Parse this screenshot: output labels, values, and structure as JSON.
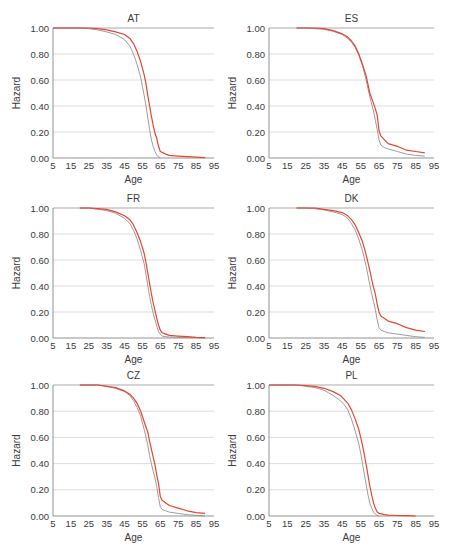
{
  "figure": {
    "colors": {
      "series_gray": "#8c9196",
      "series_red": "#e8452e",
      "grid": "#d4d4d4",
      "axis": "#777777",
      "top_line": "#a9a9a9"
    }
  },
  "chart_data": [
    {
      "type": "line",
      "title": "AT",
      "xlabel": "Age",
      "ylabel": "Hazard",
      "xlim": [
        5,
        95
      ],
      "ylim": [
        0,
        1
      ],
      "xticks": [
        "5",
        "15",
        "25",
        "35",
        "45",
        "55",
        "65",
        "75",
        "85",
        "95"
      ],
      "yticks": [
        "0.00",
        "0.20",
        "0.40",
        "0.60",
        "0.80",
        "1.00"
      ],
      "grid": true,
      "legend": null,
      "series": [
        {
          "name": "gray",
          "x": [
            5,
            15,
            20,
            25,
            30,
            35,
            40,
            45,
            48,
            50,
            52,
            54,
            55,
            56,
            57,
            58,
            59,
            60,
            61,
            62,
            63,
            64,
            65
          ],
          "values": [
            1.0,
            1.0,
            1.0,
            0.995,
            0.985,
            0.97,
            0.95,
            0.91,
            0.86,
            0.8,
            0.72,
            0.62,
            0.55,
            0.48,
            0.4,
            0.31,
            0.22,
            0.14,
            0.09,
            0.05,
            0.02,
            0.01,
            0.0
          ]
        },
        {
          "name": "red",
          "x": [
            5,
            15,
            20,
            25,
            30,
            35,
            40,
            45,
            48,
            50,
            52,
            54,
            56,
            57,
            58,
            59,
            60,
            61,
            62,
            63,
            64,
            65,
            68,
            70,
            75,
            80,
            85,
            90
          ],
          "values": [
            1.0,
            1.0,
            1.0,
            1.0,
            0.995,
            0.985,
            0.97,
            0.95,
            0.92,
            0.88,
            0.82,
            0.74,
            0.64,
            0.57,
            0.48,
            0.4,
            0.32,
            0.25,
            0.19,
            0.15,
            0.09,
            0.05,
            0.03,
            0.02,
            0.015,
            0.01,
            0.007,
            0.003
          ]
        }
      ]
    },
    {
      "type": "line",
      "title": "ES",
      "xlabel": "Age",
      "ylabel": "Hazard",
      "xlim": [
        5,
        95
      ],
      "ylim": [
        0,
        1
      ],
      "xticks": [
        "5",
        "15",
        "25",
        "35",
        "45",
        "55",
        "65",
        "75",
        "85",
        "95"
      ],
      "yticks": [
        "0.00",
        "0.20",
        "0.40",
        "0.60",
        "0.80",
        "1.00"
      ],
      "grid": true,
      "legend": null,
      "series": [
        {
          "name": "gray",
          "x": [
            20,
            25,
            30,
            35,
            40,
            45,
            48,
            50,
            52,
            54,
            56,
            58,
            60,
            62,
            63,
            64,
            65,
            66,
            68,
            70,
            75,
            80,
            85,
            90
          ],
          "values": [
            1.0,
            1.0,
            0.995,
            0.99,
            0.975,
            0.95,
            0.92,
            0.89,
            0.85,
            0.79,
            0.71,
            0.6,
            0.47,
            0.36,
            0.29,
            0.22,
            0.14,
            0.1,
            0.08,
            0.07,
            0.05,
            0.03,
            0.02,
            0.015
          ]
        },
        {
          "name": "red",
          "x": [
            20,
            25,
            30,
            35,
            40,
            45,
            48,
            50,
            52,
            54,
            56,
            58,
            60,
            62,
            63,
            64,
            65,
            66,
            68,
            70,
            75,
            80,
            85,
            90
          ],
          "values": [
            1.0,
            1.0,
            1.0,
            0.995,
            0.98,
            0.955,
            0.93,
            0.9,
            0.86,
            0.8,
            0.72,
            0.63,
            0.5,
            0.42,
            0.38,
            0.33,
            0.21,
            0.17,
            0.14,
            0.11,
            0.09,
            0.06,
            0.05,
            0.04
          ]
        }
      ]
    },
    {
      "type": "line",
      "title": "FR",
      "xlabel": "Age",
      "ylabel": "Hazard",
      "xlim": [
        5,
        95
      ],
      "ylim": [
        0,
        1
      ],
      "xticks": [
        "5",
        "15",
        "25",
        "35",
        "45",
        "55",
        "65",
        "75",
        "85",
        "95"
      ],
      "yticks": [
        "0.00",
        "0.20",
        "0.40",
        "0.60",
        "0.80",
        "1.00"
      ],
      "grid": true,
      "legend": null,
      "series": [
        {
          "name": "gray",
          "x": [
            20,
            25,
            30,
            35,
            40,
            45,
            48,
            50,
            52,
            54,
            56,
            57,
            58,
            59,
            60,
            61,
            62,
            63,
            64,
            65,
            66,
            68,
            70,
            75,
            80,
            85,
            90
          ],
          "values": [
            1.0,
            1.0,
            0.99,
            0.98,
            0.96,
            0.92,
            0.88,
            0.83,
            0.76,
            0.67,
            0.57,
            0.49,
            0.4,
            0.32,
            0.25,
            0.19,
            0.14,
            0.09,
            0.05,
            0.03,
            0.015,
            0.01,
            0.008,
            0.005,
            0.003,
            0.002,
            0.0
          ]
        },
        {
          "name": "red",
          "x": [
            20,
            25,
            30,
            35,
            40,
            45,
            48,
            50,
            52,
            54,
            56,
            57,
            58,
            59,
            60,
            61,
            62,
            63,
            64,
            65,
            66,
            68,
            70,
            75,
            80,
            85,
            90
          ],
          "values": [
            1.0,
            1.0,
            0.995,
            0.99,
            0.97,
            0.94,
            0.91,
            0.87,
            0.81,
            0.74,
            0.65,
            0.58,
            0.5,
            0.42,
            0.34,
            0.27,
            0.21,
            0.15,
            0.1,
            0.06,
            0.04,
            0.03,
            0.02,
            0.015,
            0.01,
            0.005,
            0.002
          ]
        }
      ]
    },
    {
      "type": "line",
      "title": "DK",
      "xlabel": "Age",
      "ylabel": "Hazard",
      "xlim": [
        5,
        95
      ],
      "ylim": [
        0,
        1
      ],
      "xticks": [
        "5",
        "15",
        "25",
        "35",
        "45",
        "55",
        "65",
        "75",
        "85",
        "95"
      ],
      "yticks": [
        "0.00",
        "0.20",
        "0.40",
        "0.60",
        "0.80",
        "1.00"
      ],
      "grid": true,
      "legend": null,
      "series": [
        {
          "name": "gray",
          "x": [
            20,
            25,
            30,
            35,
            40,
            45,
            48,
            50,
            52,
            54,
            56,
            58,
            60,
            61,
            62,
            63,
            64,
            65,
            66,
            68,
            70,
            75,
            80,
            85,
            90
          ],
          "values": [
            1.0,
            1.0,
            0.995,
            0.985,
            0.97,
            0.95,
            0.92,
            0.88,
            0.83,
            0.76,
            0.67,
            0.55,
            0.41,
            0.34,
            0.28,
            0.22,
            0.14,
            0.08,
            0.06,
            0.05,
            0.04,
            0.03,
            0.02,
            0.01,
            0.005
          ]
        },
        {
          "name": "red",
          "x": [
            20,
            25,
            30,
            35,
            40,
            45,
            48,
            50,
            52,
            54,
            56,
            58,
            60,
            61,
            62,
            63,
            64,
            65,
            66,
            68,
            70,
            75,
            80,
            85,
            90
          ],
          "values": [
            1.0,
            1.0,
            1.0,
            0.99,
            0.98,
            0.965,
            0.94,
            0.91,
            0.87,
            0.81,
            0.74,
            0.64,
            0.52,
            0.45,
            0.39,
            0.34,
            0.26,
            0.2,
            0.17,
            0.15,
            0.13,
            0.11,
            0.08,
            0.06,
            0.05
          ]
        }
      ]
    },
    {
      "type": "line",
      "title": "CZ",
      "xlabel": "Age",
      "ylabel": "Hazard",
      "xlim": [
        5,
        95
      ],
      "ylim": [
        0,
        1
      ],
      "xticks": [
        "5",
        "15",
        "25",
        "35",
        "45",
        "55",
        "65",
        "75",
        "85",
        "95"
      ],
      "yticks": [
        "0.00",
        "0.20",
        "0.40",
        "0.60",
        "0.80",
        "1.00"
      ],
      "grid": true,
      "legend": null,
      "series": [
        {
          "name": "gray",
          "x": [
            20,
            25,
            30,
            35,
            40,
            45,
            48,
            50,
            52,
            54,
            56,
            58,
            59,
            60,
            61,
            62,
            63,
            64,
            65,
            66,
            68,
            70,
            75,
            80,
            85,
            90
          ],
          "values": [
            1.0,
            1.0,
            1.0,
            0.99,
            0.975,
            0.95,
            0.92,
            0.88,
            0.83,
            0.76,
            0.66,
            0.54,
            0.46,
            0.4,
            0.34,
            0.29,
            0.22,
            0.14,
            0.07,
            0.05,
            0.04,
            0.03,
            0.02,
            0.01,
            0.005,
            0.0
          ]
        },
        {
          "name": "red",
          "x": [
            20,
            25,
            30,
            35,
            40,
            45,
            48,
            50,
            52,
            54,
            56,
            58,
            59,
            60,
            61,
            62,
            63,
            64,
            65,
            66,
            68,
            70,
            75,
            80,
            85,
            90
          ],
          "values": [
            1.0,
            1.0,
            1.0,
            0.99,
            0.98,
            0.955,
            0.93,
            0.9,
            0.86,
            0.8,
            0.72,
            0.64,
            0.57,
            0.51,
            0.45,
            0.39,
            0.31,
            0.25,
            0.15,
            0.12,
            0.1,
            0.08,
            0.06,
            0.04,
            0.025,
            0.02
          ]
        }
      ]
    },
    {
      "type": "line",
      "title": "PL",
      "xlabel": "Age",
      "ylabel": "Hazard",
      "xlim": [
        5,
        95
      ],
      "ylim": [
        0,
        1
      ],
      "xticks": [
        "5",
        "15",
        "25",
        "35",
        "45",
        "55",
        "65",
        "75",
        "85",
        "95"
      ],
      "yticks": [
        "0.00",
        "0.20",
        "0.40",
        "0.60",
        "0.80",
        "1.00"
      ],
      "grid": true,
      "legend": null,
      "series": [
        {
          "name": "gray",
          "x": [
            5,
            15,
            20,
            25,
            30,
            35,
            40,
            44,
            46,
            48,
            50,
            52,
            54,
            55,
            56,
            57,
            58,
            59,
            60,
            61,
            62,
            63,
            64,
            65
          ],
          "values": [
            1.0,
            1.0,
            1.0,
            0.99,
            0.98,
            0.96,
            0.92,
            0.88,
            0.85,
            0.81,
            0.74,
            0.65,
            0.55,
            0.48,
            0.4,
            0.32,
            0.24,
            0.16,
            0.1,
            0.06,
            0.03,
            0.015,
            0.005,
            0.0
          ]
        },
        {
          "name": "red",
          "x": [
            5,
            15,
            20,
            25,
            30,
            35,
            40,
            44,
            46,
            48,
            50,
            52,
            54,
            55,
            56,
            57,
            58,
            59,
            60,
            61,
            62,
            63,
            64,
            65,
            68,
            70,
            75,
            80,
            85
          ],
          "values": [
            1.0,
            1.0,
            1.0,
            0.995,
            0.99,
            0.975,
            0.95,
            0.92,
            0.89,
            0.86,
            0.81,
            0.74,
            0.66,
            0.6,
            0.54,
            0.47,
            0.39,
            0.31,
            0.23,
            0.16,
            0.1,
            0.06,
            0.03,
            0.02,
            0.01,
            0.006,
            0.004,
            0.002,
            0.0
          ]
        }
      ]
    }
  ],
  "panels_layout": [
    {
      "x0": 53,
      "x1": 214,
      "y1": 28,
      "y0": 158
    },
    {
      "x0": 269,
      "x1": 434,
      "y1": 28,
      "y0": 158
    },
    {
      "x0": 53,
      "x1": 214,
      "y1": 208,
      "y0": 338
    },
    {
      "x0": 269,
      "x1": 434,
      "y1": 208,
      "y0": 338
    },
    {
      "x0": 53,
      "x1": 214,
      "y1": 385,
      "y0": 516
    },
    {
      "x0": 269,
      "x1": 434,
      "y1": 385,
      "y0": 516
    }
  ]
}
